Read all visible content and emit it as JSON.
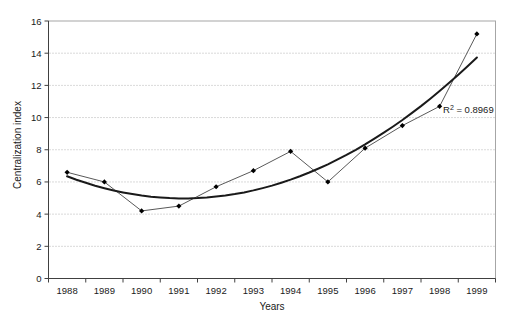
{
  "chart_data": {
    "type": "line",
    "title": "",
    "xlabel": "Years",
    "ylabel": "Centralization index",
    "categories": [
      "1988",
      "1989",
      "1990",
      "1991",
      "1992",
      "1993",
      "1994",
      "1995",
      "1996",
      "1997",
      "1998",
      "1999"
    ],
    "series": [
      {
        "name": "Centralization index",
        "values": [
          6.6,
          6.0,
          4.2,
          4.5,
          5.7,
          6.7,
          7.9,
          6.0,
          8.1,
          9.5,
          10.7,
          15.2
        ],
        "marker": "diamond",
        "line_color": "#595959",
        "marker_color": "#000000"
      }
    ],
    "trendline": {
      "type": "polynomial",
      "order": 2,
      "coefficients": [
        0.141,
        -0.88,
        6.35
      ],
      "color": "#1a1a1a",
      "r_squared": 0.8969
    },
    "annotation": {
      "prefix": "R",
      "sup": "2",
      "rest": " = 0.8969"
    },
    "ylim": [
      0,
      16
    ],
    "ytick_step": 2,
    "yticks": [
      0,
      2,
      4,
      6,
      8,
      10,
      12,
      14,
      16
    ],
    "grid": "horizontal-dotted",
    "legend": "none",
    "colors": {
      "gridline": "#b3b3b3",
      "plot_border": "#a6a6a6",
      "axis": "#404040",
      "text": "#1a1a1a",
      "background": "#ffffff"
    }
  }
}
